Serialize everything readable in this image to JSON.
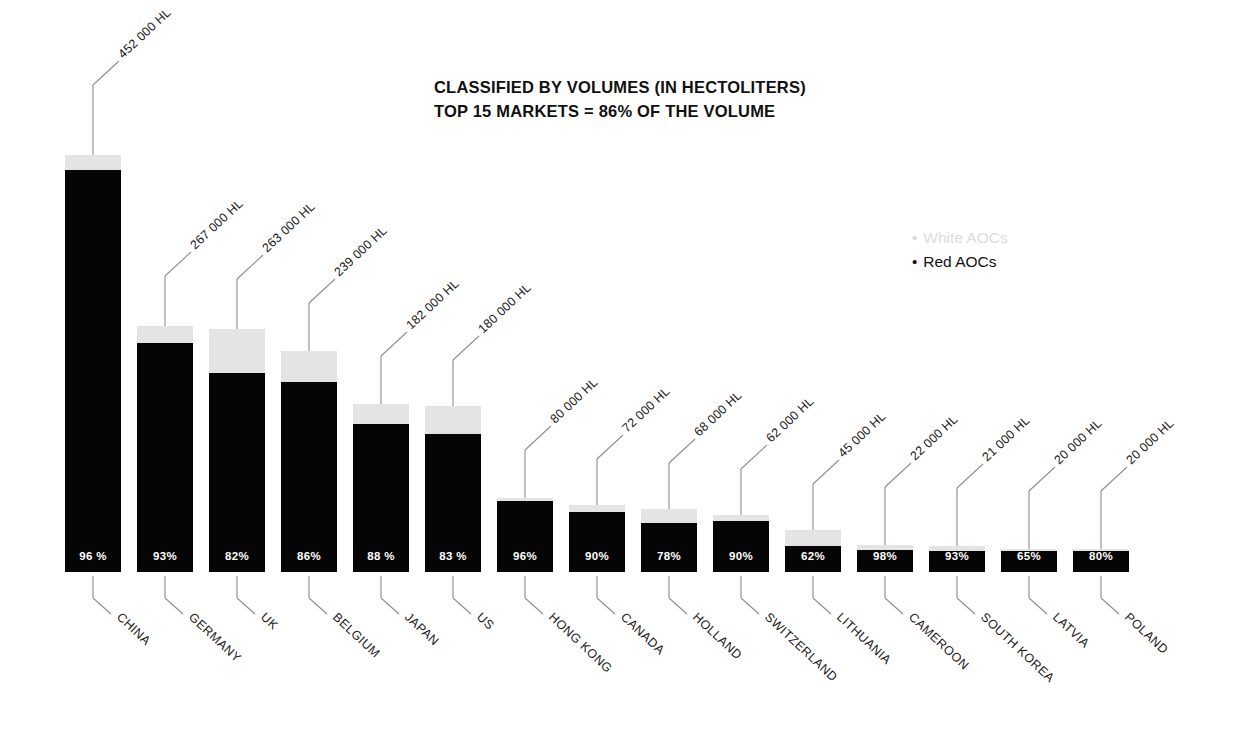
{
  "title": {
    "line1": "CLASSIFIED BY VOLUMES (IN HECTOLITERS)",
    "line2": "TOP 15 MARKETS = 86% OF THE VOLUME"
  },
  "legend": {
    "items": [
      {
        "label": "White AOCs",
        "color": "#dcdcdc",
        "bullet": "•"
      },
      {
        "label": "Red AOCs",
        "color": "#111111",
        "bullet": "•"
      }
    ]
  },
  "chart_data": {
    "type": "bar",
    "subtype": "stacked-bar",
    "xlabel": "",
    "ylabel": "",
    "ylim": [
      0,
      452000
    ],
    "grid": false,
    "legend_position": "right",
    "unit": "HL",
    "categories": [
      "CHINA",
      "GERMANY",
      "UK",
      "BELGIUM",
      "JAPAN",
      "US",
      "HONG KONG",
      "CANADA",
      "HOLLAND",
      "SWITZERLAND",
      "LITHUANIA",
      "CAMEROON",
      "SOUTH KOREA",
      "LATVIA",
      "POLAND"
    ],
    "values": [
      452000,
      267000,
      263000,
      239000,
      182000,
      180000,
      80000,
      72000,
      68000,
      62000,
      45000,
      22000,
      21000,
      20000,
      20000
    ],
    "value_labels": [
      "452 000 HL",
      "267 000 HL",
      "263 000 HL",
      "239 000 HL",
      "182 000 HL",
      "180 000 HL",
      "80 000 HL",
      "72 000 HL",
      "68 000 HL",
      "62 000 HL",
      "45 000 HL",
      "22 000 HL",
      "21 000 HL",
      "20 000 HL",
      "20 000 HL"
    ],
    "red_share_labels": [
      "96 %",
      "93%",
      "82%",
      "86%",
      "88 %",
      "83 %",
      "96%",
      "90%",
      "78%",
      "90%",
      "62%",
      "98%",
      "93%",
      "65%",
      "80%"
    ],
    "red_share_pct": [
      96,
      93,
      82,
      86,
      88,
      83,
      96,
      90,
      78,
      90,
      62,
      98,
      93,
      65,
      80
    ],
    "series": [
      {
        "name": "Red AOCs",
        "color": "#050505",
        "values": [
          433920,
          248310,
          215660,
          205540,
          160160,
          149400,
          76800,
          64800,
          53040,
          55800,
          27900,
          21560,
          19530,
          13000,
          16000
        ]
      },
      {
        "name": "White AOCs",
        "color": "#e4e4e4",
        "values": [
          18080,
          18690,
          47340,
          33460,
          21840,
          30600,
          3200,
          7200,
          14960,
          6200,
          17100,
          440,
          1470,
          7000,
          4000
        ]
      }
    ]
  },
  "bars": [
    {
      "category": "CHINA",
      "value_label": "452 000 HL",
      "pct_label": "96 %",
      "x": 65,
      "total_h": 417,
      "white_h": 15,
      "lead_up": 70,
      "lead_dx": 26,
      "lead_dy": 24
    },
    {
      "category": "GERMANY",
      "value_label": "267 000 HL",
      "pct_label": "93%",
      "x": 137,
      "total_h": 246,
      "white_h": 17,
      "lead_up": 50,
      "lead_dx": 26,
      "lead_dy": 24
    },
    {
      "category": "UK",
      "value_label": "263 000 HL",
      "pct_label": "82%",
      "x": 209,
      "total_h": 243,
      "white_h": 44,
      "lead_up": 50,
      "lead_dx": 26,
      "lead_dy": 24
    },
    {
      "category": "BELGIUM",
      "value_label": "239 000 HL",
      "pct_label": "86%",
      "x": 281,
      "total_h": 221,
      "white_h": 31,
      "lead_up": 48,
      "lead_dx": 26,
      "lead_dy": 24
    },
    {
      "category": "JAPAN",
      "value_label": "182 000 HL",
      "pct_label": "88 %",
      "x": 353,
      "total_h": 168,
      "white_h": 20,
      "lead_up": 48,
      "lead_dx": 26,
      "lead_dy": 24
    },
    {
      "category": "US",
      "value_label": "180 000 HL",
      "pct_label": "83 %",
      "x": 425,
      "total_h": 166,
      "white_h": 28,
      "lead_up": 46,
      "lead_dx": 26,
      "lead_dy": 24
    },
    {
      "category": "HONG KONG",
      "value_label": "80 000 HL",
      "pct_label": "96%",
      "x": 497,
      "total_h": 74,
      "white_h": 3,
      "lead_up": 48,
      "lead_dx": 26,
      "lead_dy": 24
    },
    {
      "category": "CANADA",
      "value_label": "72 000 HL",
      "pct_label": "90%",
      "x": 569,
      "total_h": 67,
      "white_h": 7,
      "lead_up": 46,
      "lead_dx": 26,
      "lead_dy": 24
    },
    {
      "category": "HOLLAND",
      "value_label": "68 000 HL",
      "pct_label": "78%",
      "x": 641,
      "total_h": 63,
      "white_h": 14,
      "lead_up": 46,
      "lead_dx": 26,
      "lead_dy": 24
    },
    {
      "category": "SWITZERLAND",
      "value_label": "62 000 HL",
      "pct_label": "90%",
      "x": 713,
      "total_h": 57,
      "white_h": 6,
      "lead_up": 46,
      "lead_dx": 26,
      "lead_dy": 24
    },
    {
      "category": "LITHUANIA",
      "value_label": "45 000 HL",
      "pct_label": "62%",
      "x": 785,
      "total_h": 42,
      "white_h": 16,
      "lead_up": 46,
      "lead_dx": 26,
      "lead_dy": 24
    },
    {
      "category": "CAMEROON",
      "value_label": "22 000 HL",
      "pct_label": "98%",
      "x": 857,
      "total_h": 27,
      "white_h": 5,
      "lead_up": 58,
      "lead_dx": 26,
      "lead_dy": 24
    },
    {
      "category": "SOUTH KOREA",
      "value_label": "21 000 HL",
      "pct_label": "93%",
      "x": 929,
      "total_h": 26,
      "white_h": 5,
      "lead_up": 58,
      "lead_dx": 26,
      "lead_dy": 24
    },
    {
      "category": "LATVIA",
      "value_label": "20 000 HL",
      "pct_label": "65%",
      "x": 1001,
      "total_h": 23,
      "white_h": 2,
      "lead_up": 58,
      "lead_dx": 26,
      "lead_dy": 24
    },
    {
      "category": "POLAND",
      "value_label": "20 000 HL",
      "pct_label": "80%",
      "x": 1073,
      "total_h": 23,
      "white_h": 2,
      "lead_up": 58,
      "lead_dx": 26,
      "lead_dy": 24
    }
  ]
}
